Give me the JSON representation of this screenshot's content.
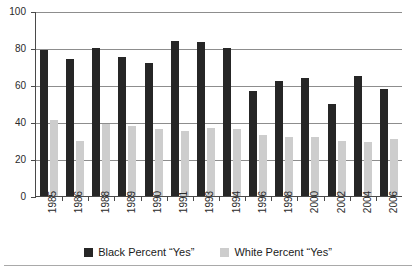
{
  "chart_data": {
    "type": "bar",
    "title": "",
    "subtitle": "",
    "xlabel": "",
    "ylabel": "",
    "ylim": [
      0,
      100
    ],
    "yticks": [
      0,
      20,
      40,
      60,
      80,
      100
    ],
    "ytick_labels": [
      "0",
      "20",
      "40",
      "60",
      "80",
      "100"
    ],
    "grid": true,
    "legend_position": "bottom",
    "categories": [
      "1985",
      "1986",
      "1988",
      "1989",
      "1990",
      "1991",
      "1993",
      "1994",
      "1996",
      "1998",
      "2000",
      "2002",
      "2004",
      "2006"
    ],
    "series": [
      {
        "name": "Black Percent “Yes”",
        "color": "#262626",
        "values": [
          79,
          74,
          80,
          75,
          72,
          84,
          83,
          80,
          57,
          62,
          64,
          50,
          65,
          58
        ]
      },
      {
        "name": "White Percent “Yes”",
        "color": "#cdcdcd",
        "values": [
          41,
          30,
          39,
          38,
          36,
          35,
          37,
          36,
          33,
          32,
          32,
          30,
          29,
          31
        ]
      }
    ]
  },
  "legend": {
    "items": [
      {
        "label": "Black Percent “Yes”",
        "swatch": "black"
      },
      {
        "label": "White Percent “Yes”",
        "swatch": "white"
      }
    ]
  }
}
